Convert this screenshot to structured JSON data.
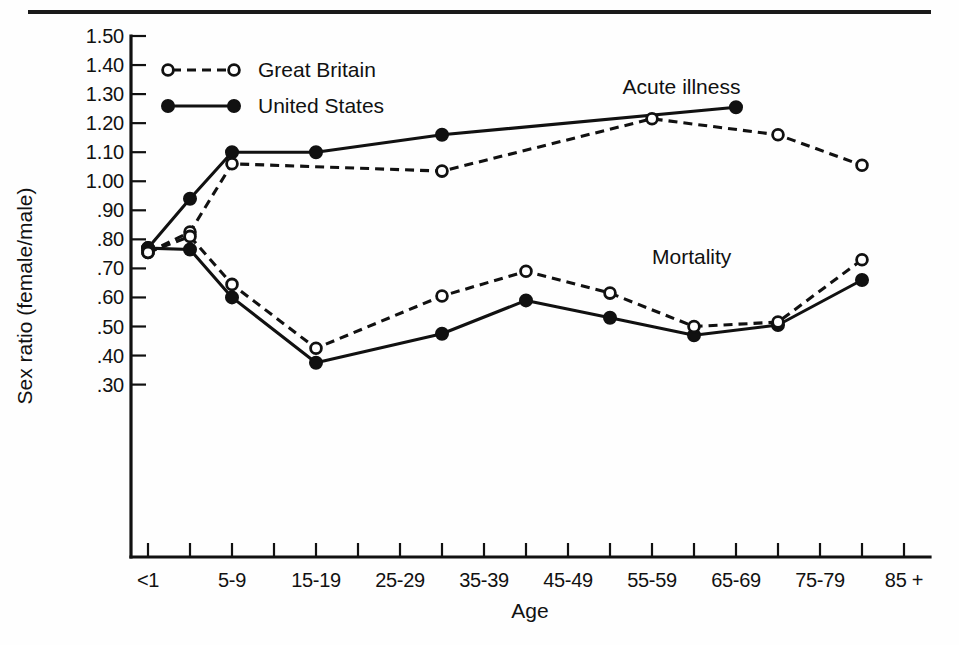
{
  "chart_data": {
    "type": "line",
    "title": "",
    "xlabel": "Age",
    "ylabel": "Sex ratio (female/male)",
    "ylim": [
      0.25,
      1.5
    ],
    "xlim": [
      0,
      20
    ],
    "grid": false,
    "legend_position": "top-left",
    "y_ticks": [
      "1.50",
      "1.40",
      "1.30",
      "1.20",
      "1.10",
      "1.00",
      ".90",
      ".80",
      ".70",
      ".60",
      ".50",
      ".40",
      ".30"
    ],
    "y_tick_values": [
      1.5,
      1.4,
      1.3,
      1.2,
      1.1,
      1.0,
      0.9,
      0.8,
      0.7,
      0.6,
      0.5,
      0.4,
      0.3
    ],
    "categories": [
      "<1",
      "1-4",
      "5-9",
      "10-14",
      "15-19",
      "20-24",
      "25-29",
      "30-34",
      "35-39",
      "40-44",
      "45-49",
      "50-54",
      "55-59",
      "60-64",
      "65-69",
      "70-74",
      "75-79",
      "80-84",
      "85 +"
    ],
    "x_tick_labels": [
      "<1",
      "",
      "5-9",
      "",
      "15-19",
      "",
      "25-29",
      "",
      "35-39",
      "",
      "45-49",
      "",
      "55-59",
      "",
      "65-69",
      "",
      "75-79",
      "",
      "85 +"
    ],
    "annotations": [
      {
        "text": "Acute illness",
        "x": 11.3,
        "y": 1.3
      },
      {
        "text": "Mortality",
        "x": 12.0,
        "y": 0.715
      }
    ],
    "legend": [
      {
        "name": "Great Britain",
        "marker": "open-circle",
        "line": "dashed"
      },
      {
        "name": "United States",
        "marker": "filled-circle",
        "line": "solid"
      }
    ],
    "series": [
      {
        "name": "Acute illness — United States",
        "country": "United States",
        "measure": "Acute illness",
        "marker": "filled-circle",
        "line": "solid",
        "points": [
          {
            "category": "<1",
            "x": 0,
            "y": 0.77
          },
          {
            "category": "1-4",
            "x": 1,
            "y": 0.94
          },
          {
            "category": "5-9",
            "x": 2,
            "y": 1.1
          },
          {
            "category": "15-19",
            "x": 4,
            "y": 1.1
          },
          {
            "category": "30-34",
            "x": 7,
            "y": 1.16
          },
          {
            "category": "65-69",
            "x": 14,
            "y": 1.255
          }
        ]
      },
      {
        "name": "Acute illness — Great Britain",
        "country": "Great Britain",
        "measure": "Acute illness",
        "marker": "open-circle",
        "line": "dashed",
        "points": [
          {
            "category": "<1",
            "x": 0,
            "y": 0.755
          },
          {
            "category": "1-4",
            "x": 1,
            "y": 0.825
          },
          {
            "category": "5-9",
            "x": 2,
            "y": 1.06
          },
          {
            "category": "30-34",
            "x": 7,
            "y": 1.035
          },
          {
            "category": "55-59",
            "x": 12,
            "y": 1.215
          },
          {
            "category": "70-74",
            "x": 15,
            "y": 1.16
          },
          {
            "category": "80-84",
            "x": 17,
            "y": 1.055
          }
        ]
      },
      {
        "name": "Mortality — United States",
        "country": "United States",
        "measure": "Mortality",
        "marker": "filled-circle",
        "line": "solid",
        "points": [
          {
            "category": "<1",
            "x": 0,
            "y": 0.77
          },
          {
            "category": "1-4",
            "x": 1,
            "y": 0.765
          },
          {
            "category": "5-9",
            "x": 2,
            "y": 0.6
          },
          {
            "category": "15-19",
            "x": 4,
            "y": 0.375
          },
          {
            "category": "30-34",
            "x": 7,
            "y": 0.475
          },
          {
            "category": "40-44",
            "x": 9,
            "y": 0.59
          },
          {
            "category": "50-54",
            "x": 11,
            "y": 0.53
          },
          {
            "category": "60-64",
            "x": 13,
            "y": 0.47
          },
          {
            "category": "70-74",
            "x": 15,
            "y": 0.505
          },
          {
            "category": "80-84",
            "x": 17,
            "y": 0.66
          }
        ]
      },
      {
        "name": "Mortality — Great Britain",
        "country": "Great Britain",
        "measure": "Mortality",
        "marker": "open-circle",
        "line": "dashed",
        "points": [
          {
            "category": "<1",
            "x": 0,
            "y": 0.755
          },
          {
            "category": "1-4",
            "x": 1,
            "y": 0.81
          },
          {
            "category": "5-9",
            "x": 2,
            "y": 0.645
          },
          {
            "category": "15-19",
            "x": 4,
            "y": 0.425
          },
          {
            "category": "30-34",
            "x": 7,
            "y": 0.605
          },
          {
            "category": "40-44",
            "x": 9,
            "y": 0.69
          },
          {
            "category": "50-54",
            "x": 11,
            "y": 0.615
          },
          {
            "category": "60-64",
            "x": 13,
            "y": 0.5
          },
          {
            "category": "70-74",
            "x": 15,
            "y": 0.515
          },
          {
            "category": "80-84",
            "x": 17,
            "y": 0.73
          }
        ]
      }
    ]
  },
  "colors": {
    "ink": "#111111",
    "background": "#fefefe",
    "marker_fill_open": "#ffffff"
  }
}
